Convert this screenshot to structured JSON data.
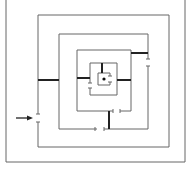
{
  "diagram": {
    "type": "concentric-square-maze",
    "colors": {
      "line": "#555555",
      "wall": "#222222",
      "background": "#ffffff"
    },
    "entrance_arrow": {
      "direction": "right",
      "label": ""
    },
    "center_marker": "dot"
  }
}
